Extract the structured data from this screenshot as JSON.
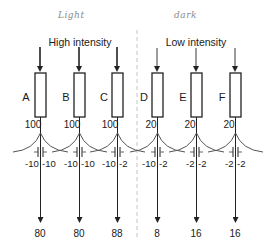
{
  "annotations": {
    "left_handwritten": "Light",
    "right_handwritten": "dark"
  },
  "groups": [
    {
      "title": "High intensity",
      "center_x": 79
    },
    {
      "title": "Low intensity",
      "center_x": 196
    }
  ],
  "cells": [
    {
      "label": "A",
      "x": 40,
      "input": "100",
      "coupling_left": "-10",
      "coupling_right": "-10",
      "output": "80"
    },
    {
      "label": "B",
      "x": 79,
      "input": "100",
      "coupling_left": "-10",
      "coupling_right": "-10",
      "output": "80"
    },
    {
      "label": "C",
      "x": 117,
      "input": "100",
      "coupling_left": "-10",
      "coupling_right": "-2",
      "output": "88"
    },
    {
      "label": "D",
      "x": 157,
      "input": "20",
      "coupling_left": "-10",
      "coupling_right": "-2",
      "output": "8"
    },
    {
      "label": "E",
      "x": 196,
      "input": "20",
      "coupling_left": "-2",
      "coupling_right": "-2",
      "output": "16"
    },
    {
      "label": "F",
      "x": 235,
      "input": "20",
      "coupling_left": "-2",
      "coupling_right": "-2",
      "output": "16"
    }
  ],
  "colors": {
    "line": "#222222",
    "curve": "#555555",
    "divider": "#bbbbbb",
    "handwriting": "#8a8a8a"
  }
}
